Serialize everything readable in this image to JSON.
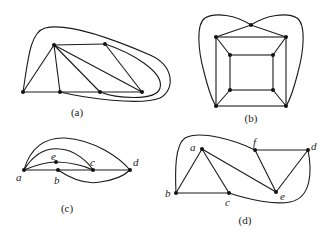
{
  "figure": {
    "panels": [
      {
        "id": "a",
        "caption": "(a)",
        "vertex_labels": []
      },
      {
        "id": "b",
        "caption": "(b)",
        "vertex_labels": []
      },
      {
        "id": "c",
        "caption": "(c)",
        "vertex_labels": [
          "a",
          "b",
          "c",
          "d",
          "e"
        ]
      },
      {
        "id": "d",
        "caption": "(d)",
        "vertex_labels": [
          "a",
          "b",
          "c",
          "d",
          "e",
          "f"
        ]
      }
    ]
  },
  "labels": {
    "c": {
      "a": "a",
      "b": "b",
      "c": "c",
      "d": "d",
      "e": "e"
    },
    "d": {
      "a": "a",
      "b": "b",
      "c": "c",
      "d": "d",
      "e": "e",
      "f": "f"
    }
  },
  "colors": {
    "ink": "#1a1a1a",
    "background": "#ffffff"
  }
}
